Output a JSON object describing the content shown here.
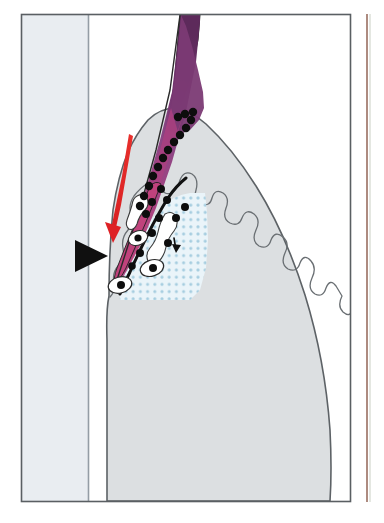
{
  "figure": {
    "domain_label": "histology-diagram",
    "canvas": {
      "width": 384,
      "height": 523,
      "background": "#ffffff"
    },
    "panel": {
      "name": "main-panel",
      "frame": {
        "x": 21,
        "y": 14,
        "width": 330,
        "height": 488
      },
      "frame_stroke": "#555a5e",
      "frame_fill": "#ffffff"
    },
    "neighbor_panel": {
      "name": "adjacent-panel-sliver",
      "x": 366,
      "y": 14,
      "width": 18,
      "height": 488,
      "edge_color": "#8a5a4a",
      "fill": "#ffffff"
    }
  },
  "regions": [
    {
      "id": "background-band",
      "label": "left background band",
      "fill": "#e4e9ee",
      "stroke": "#9aa3ab",
      "x": 21,
      "y": 14,
      "width": 67,
      "height": 488
    },
    {
      "id": "band-divider-line",
      "label": "vertical divider line",
      "stroke": "#8e979f",
      "x": 88,
      "y_top": 14,
      "y_bottom": 502
    },
    {
      "id": "organ-mass",
      "label": "gray tissue mass",
      "fill": "#dcdfe1",
      "stroke": "#5d6266",
      "stroke_width": 1.4
    },
    {
      "id": "inner-scalloped-boundary",
      "label": "wavy internal tissue boundary",
      "fill": "#e6e8ea",
      "stroke": "#6a6f73",
      "stroke_width": 1.2
    },
    {
      "id": "purple-wedge",
      "label": "purple gradient wedge",
      "gradient_top": "#6c2f68",
      "gradient_mid": "#8e4686",
      "gradient_bottom": "#c2447a",
      "stroke": "#2a2a2a"
    },
    {
      "id": "stipple-zone",
      "label": "light blue stippled zone",
      "fill": "#e8f3f8",
      "dot_color": "#a8cfe0",
      "dot_spacing": 7.2,
      "dot_radius": 1.5
    },
    {
      "id": "lumen-shapes",
      "label": "white irregular lumen outlines",
      "fill": "#ffffff",
      "stroke": "#3a3a3a",
      "stroke_width": 1.1
    }
  ],
  "markers": {
    "dot_chain": {
      "label": "black nuclei chain along interface",
      "color": "#0d0d0d",
      "radius": 4.0,
      "count": 14
    },
    "scattered_dots": {
      "label": "scattered black nuclei",
      "color": "#0d0d0d",
      "radius": 3.8,
      "count": 11
    },
    "cell_bodies": {
      "label": "white cells with black nucleus",
      "fill": "#ffffff",
      "stroke": "#2b2b2b",
      "nucleus": "#0d0d0d",
      "count": 3
    }
  },
  "annotations": [
    {
      "id": "red-arrow",
      "name": "red-migration-arrow",
      "color": "#e02a28",
      "direction": "down-left",
      "description": "tapered curved arrow indicating migration"
    },
    {
      "id": "black-arrowhead",
      "name": "black-pointer-arrowhead",
      "color": "#111111",
      "direction": "right",
      "description": "solid triangular pointer at left margin"
    },
    {
      "id": "small-black-arrow",
      "name": "small-black-arrow",
      "color": "#111111",
      "direction": "down",
      "description": "small arrow inside stippled zone"
    },
    {
      "id": "black-curve",
      "name": "black-boundary-curve",
      "color": "#111111",
      "description": "thick black curved boundary line"
    }
  ]
}
